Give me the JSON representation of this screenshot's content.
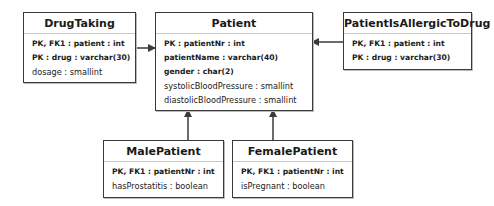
{
  "entities": {
    "drug_taking": {
      "name": "DrugTaking",
      "attributes": [
        {
          "text": "PK, FK1 : patient : int",
          "key": true
        },
        {
          "text": "PK : drug : varchar(30)",
          "key": true
        },
        {
          "text": "dosage : smallint",
          "key": false
        }
      ]
    },
    "patient": {
      "name": "Patient",
      "attributes": [
        {
          "text": "PK : patientNr : int",
          "key": true
        },
        {
          "text": "patientName : varchar(40)",
          "key": true
        },
        {
          "text": "gender : char(2)",
          "key": true
        },
        {
          "text": "systolicBloodPressure : smallint",
          "key": false
        },
        {
          "text": "diastolicBloodPressure : smallint",
          "key": false
        }
      ]
    },
    "patient_is_allergic_to_drug": {
      "name": "PatientIsAllergicToDrug",
      "attributes": [
        {
          "text": "PK, FK1 : patient : int",
          "key": true
        },
        {
          "text": "PK : drug : varchar(30)",
          "key": true
        }
      ]
    },
    "male_patient": {
      "name": "MalePatient",
      "attributes": [
        {
          "text": "PK, FK1 : patientNr : int",
          "key": true
        },
        {
          "text": "hasProstatitis : boolean",
          "key": false
        }
      ]
    },
    "female_patient": {
      "name": "FemalePatient",
      "attributes": [
        {
          "text": "PK, FK1 : patientNr : int",
          "key": true
        },
        {
          "text": "isPregnant : boolean",
          "key": false
        }
      ]
    }
  },
  "relationships": [
    {
      "from": "DrugTaking",
      "to": "Patient"
    },
    {
      "from": "PatientIsAllergicToDrug",
      "to": "Patient"
    },
    {
      "from": "MalePatient",
      "to": "Patient"
    },
    {
      "from": "FemalePatient",
      "to": "Patient"
    }
  ],
  "colors": {
    "line": "#3a3a3a",
    "divider": "#c8c8c8"
  }
}
